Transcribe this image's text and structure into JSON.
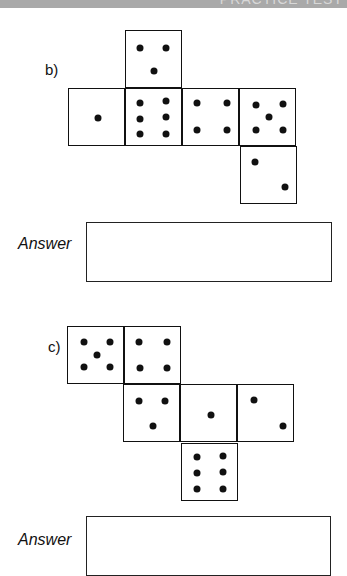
{
  "header": {
    "title": "PRACTICE TEST"
  },
  "questions": [
    {
      "label": "b)",
      "answer_label": "Answer",
      "net_faces": [
        {
          "position": "top",
          "value": 3
        },
        {
          "position": "row-1",
          "value": 1
        },
        {
          "position": "row-2",
          "value": 6
        },
        {
          "position": "row-3",
          "value": 4
        },
        {
          "position": "row-4",
          "value": 5
        },
        {
          "position": "bottom",
          "value": 2
        }
      ],
      "answer_value": ""
    },
    {
      "label": "c)",
      "answer_label": "Answer",
      "net_faces": [
        {
          "position": "top-1",
          "value": 5
        },
        {
          "position": "top-2",
          "value": 4
        },
        {
          "position": "mid-1",
          "value": 3
        },
        {
          "position": "mid-2",
          "value": 1
        },
        {
          "position": "mid-3",
          "value": 2
        },
        {
          "position": "bottom",
          "value": 6
        }
      ],
      "answer_value": ""
    }
  ]
}
